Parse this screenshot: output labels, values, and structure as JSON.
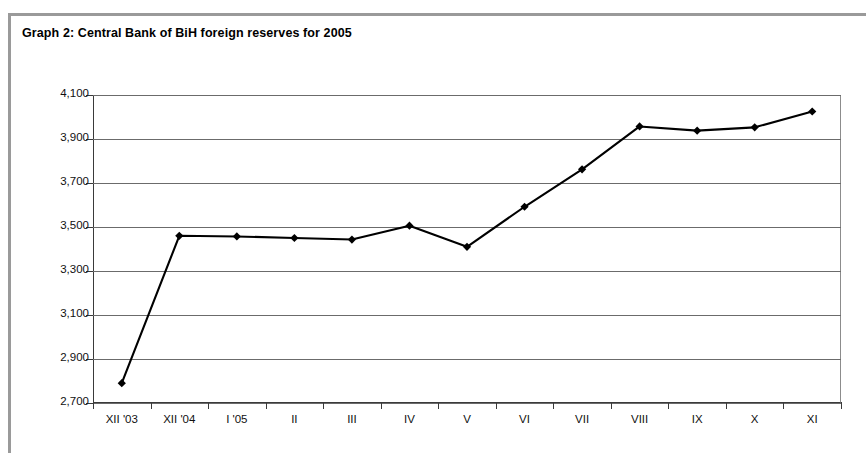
{
  "figure": {
    "title": "Graph 2: Central Bank of BiH foreign reserves for 2005"
  },
  "chart_data": {
    "type": "line",
    "title": "Graph 2: Central Bank of BiH foreign reserves for 2005",
    "xlabel": "",
    "ylabel": "",
    "categories": [
      "XII '03",
      "XII '04",
      "I '05",
      "II",
      "III",
      "IV",
      "V",
      "VI",
      "VII",
      "VIII",
      "IX",
      "X",
      "XI"
    ],
    "values": [
      2790,
      3460,
      3457,
      3450,
      3443,
      3506,
      3410,
      3592,
      3762,
      3957,
      3938,
      3953,
      4025
    ],
    "ylim": [
      2700,
      4100
    ],
    "yticks": [
      2700,
      2900,
      3100,
      3300,
      3500,
      3700,
      3900,
      4100
    ],
    "ytick_labels": [
      "2,700",
      "2,900",
      "3,100",
      "3,300",
      "3,500",
      "3,700",
      "3,900",
      "4,100"
    ],
    "grid": true,
    "legend": false,
    "marker": "diamond",
    "line_color": "#000000",
    "marker_color": "#000000"
  }
}
